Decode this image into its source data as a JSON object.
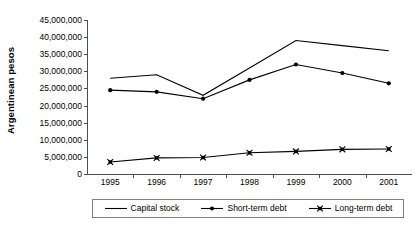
{
  "chart_data": {
    "type": "line",
    "title": "",
    "xlabel": "",
    "ylabel": "Argentinean pesos",
    "categories": [
      "1995",
      "1996",
      "1997",
      "1998",
      "1999",
      "2000",
      "2001"
    ],
    "ylim": [
      0,
      45000000
    ],
    "ytick_step": 5000000,
    "ytick_labels": [
      "45,000,000",
      "40,000,000",
      "35,000,000",
      "30,000,000",
      "25,000,000",
      "20,000,000",
      "15,000,000",
      "10,000,000",
      "5,000,000",
      "0"
    ],
    "ytick_values": [
      45000000,
      40000000,
      35000000,
      30000000,
      25000000,
      20000000,
      15000000,
      10000000,
      5000000,
      0
    ],
    "grid": false,
    "legend_position": "bottom",
    "series": [
      {
        "name": "Capital stock",
        "marker": "none",
        "color": "#000000",
        "values": [
          28000000,
          29000000,
          23000000,
          31000000,
          39000000,
          37500000,
          36000000
        ]
      },
      {
        "name": "Short-term debt",
        "marker": "circle",
        "color": "#000000",
        "values": [
          24500000,
          24000000,
          22000000,
          27500000,
          32000000,
          29500000,
          26500000
        ]
      },
      {
        "name": "Long-term debt",
        "marker": "star",
        "color": "#000000",
        "values": [
          3500000,
          4700000,
          4800000,
          6200000,
          6600000,
          7200000,
          7300000
        ]
      }
    ]
  },
  "legend": {
    "entries": [
      {
        "label": "Capital stock",
        "marker": "none"
      },
      {
        "label": "Short-term debt",
        "marker": "circle"
      },
      {
        "label": "Long-term debt",
        "marker": "star"
      }
    ]
  }
}
